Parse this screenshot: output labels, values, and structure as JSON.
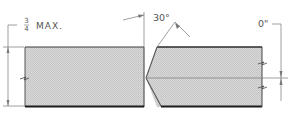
{
  "diagram": {
    "type": "welding joint detail (single bevel butt joint)",
    "labels": {
      "thickness_frac_num": "3",
      "thickness_frac_den": "4",
      "thickness_suffix": "MAX.",
      "bevel_angle": "30°",
      "root_opening": "0\""
    },
    "colors": {
      "plate_fill": "#d4d4d4",
      "plate_edge": "#444444",
      "plate_bottom_edge": "#1a1a1a",
      "dimension_line": "#666666",
      "text": "#555555",
      "background": "#ffffff"
    }
  }
}
